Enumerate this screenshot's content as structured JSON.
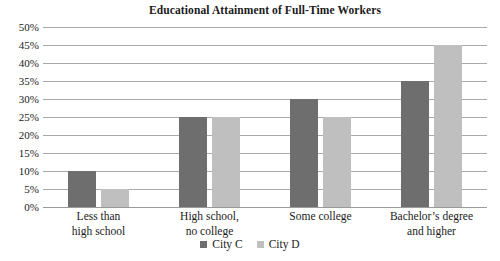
{
  "chart_data": {
    "type": "bar",
    "title": "Educational Attainment of Full-Time Workers",
    "xlabel": "",
    "ylabel": "",
    "ylim": [
      0,
      50
    ],
    "ytick_step": 5,
    "ytick_labels": [
      "50%",
      "45%",
      "40%",
      "35%",
      "30%",
      "25%",
      "20%",
      "15%",
      "10%",
      "5%",
      "0%"
    ],
    "ytick_values": [
      50,
      45,
      40,
      35,
      30,
      25,
      20,
      15,
      10,
      5,
      0
    ],
    "grid": true,
    "grid_axis": "y",
    "legend_position": "bottom",
    "categories": [
      "Less than\nhigh school",
      "High school,\nno college",
      "Some college",
      "Bachelor’s degree\nand higher"
    ],
    "series": [
      {
        "name": "City C",
        "color": "#6e6e6e",
        "values": [
          10,
          25,
          30,
          35
        ]
      },
      {
        "name": "City D",
        "color": "#bfbfbf",
        "values": [
          5,
          25,
          25,
          45
        ]
      }
    ]
  },
  "colors": {
    "background": "#ffffff",
    "gridline": "#a9a9a9",
    "text": "#1a1a1a",
    "series_c": "#6e6e6e",
    "series_d": "#bfbfbf"
  }
}
